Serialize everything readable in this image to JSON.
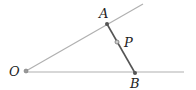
{
  "diagram": {
    "points": {
      "O": {
        "label": "O"
      },
      "A": {
        "label": "A"
      },
      "P": {
        "label": "P"
      },
      "B": {
        "label": "B"
      }
    },
    "colors": {
      "ray": "#b0b0b0",
      "segment": "#555555",
      "point": "#777777",
      "text": "#222222"
    }
  }
}
